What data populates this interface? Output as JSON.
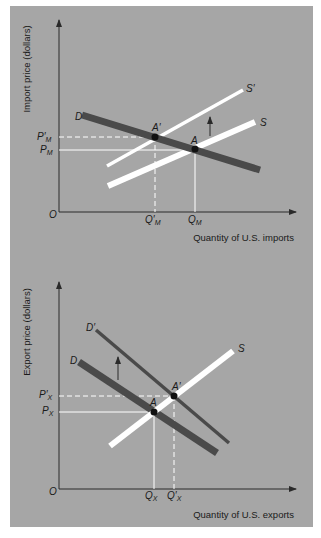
{
  "colors": {
    "background": "#ffffff",
    "panel": "#a6a6a6",
    "demand_line": "#4a4a4a",
    "supply_line": "#ffffff",
    "axis": "#2a2a2a",
    "point": "#111111",
    "guide": "#ffffff"
  },
  "import_chart": {
    "y_axis_label": "Import price (dollars)",
    "x_axis_label": "Quantity of U.S. imports",
    "origin_label": "O",
    "curves": {
      "D": "D",
      "S": "S",
      "S_prime": "S′"
    },
    "points": {
      "A": "A",
      "A_prime": "A′"
    },
    "price_ticks": {
      "P_prime": "P′",
      "P": "P",
      "sub": "M"
    },
    "quantity_ticks": {
      "Q_prime": "Q′",
      "Q": "Q",
      "sub": "M"
    },
    "shift_arrow": "up"
  },
  "export_chart": {
    "y_axis_label": "Export price (dollars)",
    "x_axis_label": "Quantity of U.S. exports",
    "origin_label": "O",
    "curves": {
      "D": "D",
      "D_prime": "D′",
      "S": "S"
    },
    "points": {
      "A": "A",
      "A_prime": "A′"
    },
    "price_ticks": {
      "P_prime": "P′",
      "P": "P",
      "sub": "X"
    },
    "quantity_ticks": {
      "Q": "Q",
      "Q_prime": "Q′",
      "sub": "X"
    },
    "shift_arrow": "up"
  }
}
